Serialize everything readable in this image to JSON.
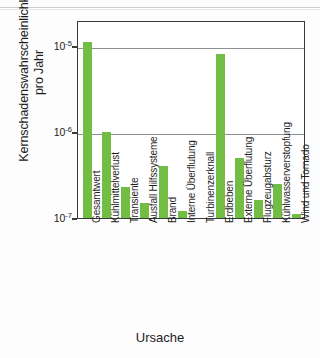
{
  "chart_data": {
    "type": "bar",
    "title": "",
    "xlabel": "Ursache",
    "ylabel": "Kernschadenswahrscheinlichkeit pro Jahr",
    "ylabel_line1": "Kernschadenswahrscheinlichkeit",
    "ylabel_line2": "pro Jahr",
    "yscale": "log",
    "ylim": [
      1e-07,
      2e-05
    ],
    "ytick_values": [
      1e-05,
      1e-06,
      1e-07
    ],
    "ytick_labels": [
      "10-5",
      "10-6",
      "10-7"
    ],
    "ytick_mantissa": "10",
    "ytick_exponents": [
      "-5",
      "-6",
      "-7"
    ],
    "grid": "horizontal",
    "legend": "none",
    "bar_color": "#72bd44",
    "axis_color": "#3b3b3b",
    "grid_color": "#8e9192",
    "categories": [
      "Gesamtwert",
      "Kühlmittelverlust",
      "Transiente",
      "Ausfall Hilfssysteme",
      "Brand",
      "Interne Überflutung",
      "Turbinenzerknall",
      "Erdbeben",
      "Externe Überflutung",
      "Flugzeugabsturz",
      "Kühlwasserverstopfung",
      "Wind und Tornado"
    ],
    "values": [
      1.1e-05,
      1e-06,
      2.3e-07,
      1.5e-07,
      4e-07,
      1.2e-07,
      0,
      8e-06,
      5e-07,
      1.6e-07,
      2.5e-07,
      1.1e-07
    ]
  }
}
